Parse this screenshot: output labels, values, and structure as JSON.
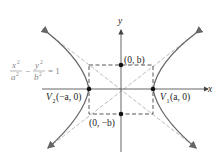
{
  "equation": {
    "x_term_num": "x",
    "x_term_exp": "2",
    "x_term_den": "a",
    "x_term_den_exp": "2",
    "minus": "−",
    "y_term_num": "y",
    "y_term_exp": "2",
    "y_term_den": "b",
    "y_term_den_exp": "2",
    "equals": "= 1"
  },
  "axes": {
    "x_label": "x",
    "y_label": "y"
  },
  "points": {
    "top": "(0, b)",
    "bottom": "(0, −b)",
    "v2_name": "V",
    "v2_sub": "2",
    "v2_coords": "(−a, 0)",
    "v1_name": "V",
    "v1_sub": "1",
    "v1_coords": "(a, 0)"
  },
  "colors": {
    "curve": "#666666",
    "asymptote": "#aaaaaa",
    "box": "#444444",
    "axis": "#555555",
    "point": "#111111"
  }
}
